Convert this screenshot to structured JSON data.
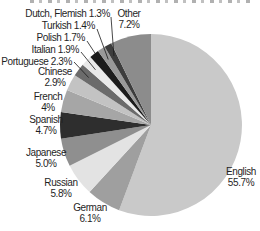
{
  "chart_data": {
    "type": "pie",
    "unit": "%",
    "start_angle_deg": 0,
    "direction": "clockwise",
    "slices": [
      {
        "label": "English",
        "pct_label": "55.7%",
        "value": 55.7,
        "color": "#c9c9c9"
      },
      {
        "label": "German",
        "pct_label": "6.1%",
        "value": 6.1,
        "color": "#9f9f9f"
      },
      {
        "label": "Russian",
        "pct_label": "5.8%",
        "value": 5.8,
        "color": "#e3e3e3"
      },
      {
        "label": "Japanese",
        "pct_label": "5.0%",
        "value": 5.0,
        "color": "#8f8f8f"
      },
      {
        "label": "Spanish",
        "pct_label": "4.7%",
        "value": 4.7,
        "color": "#2e2e2e"
      },
      {
        "label": "French",
        "pct_label": "4%",
        "value": 4.0,
        "color": "#a6a6a6"
      },
      {
        "label": "Chinese",
        "pct_label": "2.9%",
        "value": 2.9,
        "color": "#c3c3c3"
      },
      {
        "label": "Portuguese",
        "pct_label": "2.3%",
        "value": 2.3,
        "color": "#6b6b6b"
      },
      {
        "label": "Italian",
        "pct_label": "1.9%",
        "value": 1.9,
        "color": "#e9e9e9"
      },
      {
        "label": "Polish",
        "pct_label": "1.7%",
        "value": 1.7,
        "color": "#1c1c1c"
      },
      {
        "label": "Turkish",
        "pct_label": "1.4%",
        "value": 1.4,
        "color": "#999999"
      },
      {
        "label": "Dutch, Flemish",
        "pct_label": "1.3%",
        "value": 1.3,
        "color": "#3d3d3d"
      },
      {
        "label": "Other",
        "pct_label": "7.2%",
        "value": 7.2,
        "color": "#8c8c8c"
      }
    ],
    "layout": {
      "center": [
        151,
        125
      ],
      "radius": 91,
      "callout_line_color": "#1a1a1a",
      "callouts": [
        {
          "slice": "Dutch, Flemish",
          "from": [
            111,
            17
          ]
        },
        {
          "slice": "Turkish",
          "from": [
            97,
            29
          ]
        },
        {
          "slice": "Polish",
          "from": [
            87,
            41
          ]
        },
        {
          "slice": "Italian",
          "from": [
            81,
            52
          ]
        },
        {
          "slice": "Portuguese",
          "from": [
            74,
            62
          ]
        }
      ]
    }
  }
}
